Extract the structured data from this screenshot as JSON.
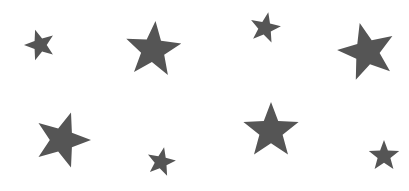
{
  "canvas": {
    "width": 409,
    "height": 191,
    "background": "#ffffff"
  },
  "star_color": "#555555",
  "stars": [
    {
      "cx": 40,
      "cy": 45,
      "r": 16,
      "rot": -18
    },
    {
      "cx": 153,
      "cy": 50,
      "r": 29,
      "rot": 5
    },
    {
      "cx": 265,
      "cy": 28,
      "r": 16,
      "rot": 12
    },
    {
      "cx": 367,
      "cy": 52,
      "r": 30,
      "rot": -14
    },
    {
      "cx": 62,
      "cy": 140,
      "r": 29,
      "rot": 18
    },
    {
      "cx": 161,
      "cy": 162,
      "r": 15,
      "rot": 12
    },
    {
      "cx": 271,
      "cy": 131,
      "r": 29,
      "rot": 0
    },
    {
      "cx": 384,
      "cy": 156,
      "r": 16,
      "rot": 0
    }
  ]
}
